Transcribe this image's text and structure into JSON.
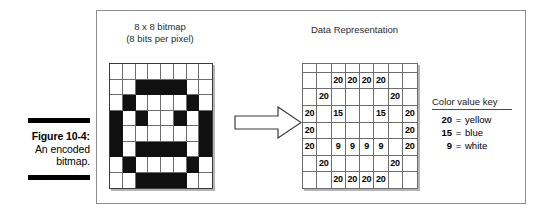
{
  "caption": {
    "figure_number": "Figure 10-4:",
    "line2": "An encoded",
    "line3": "bitmap."
  },
  "headings": {
    "bitmap_line1": "8 x 8 bitmap",
    "bitmap_line2": "(8 bits per pixel)",
    "data": "Data Representation"
  },
  "bitmap": {
    "rows": 8,
    "cols": 8,
    "pixels": [
      [
        0,
        0,
        0,
        0,
        0,
        0,
        0,
        0
      ],
      [
        0,
        0,
        1,
        1,
        1,
        1,
        0,
        0
      ],
      [
        0,
        1,
        0,
        0,
        0,
        0,
        1,
        0
      ],
      [
        1,
        0,
        1,
        0,
        0,
        1,
        0,
        1
      ],
      [
        1,
        0,
        0,
        0,
        0,
        0,
        0,
        1
      ],
      [
        1,
        0,
        1,
        1,
        1,
        1,
        0,
        1
      ],
      [
        0,
        1,
        0,
        0,
        0,
        0,
        1,
        0
      ],
      [
        0,
        0,
        1,
        1,
        1,
        1,
        0,
        0
      ]
    ]
  },
  "data_grid": {
    "rows": 8,
    "cols": 8,
    "values": [
      [
        "",
        "",
        "",
        "",
        "",
        "",
        "",
        ""
      ],
      [
        "",
        "",
        "20",
        "20",
        "20",
        "20",
        "",
        ""
      ],
      [
        "",
        "20",
        "",
        "",
        "",
        "",
        "20",
        ""
      ],
      [
        "20",
        "",
        "15",
        "",
        "",
        "15",
        "",
        "20"
      ],
      [
        "20",
        "",
        "",
        "",
        "",
        "",
        "",
        "20"
      ],
      [
        "20",
        "",
        "9",
        "9",
        "9",
        "9",
        "",
        "20"
      ],
      [
        "",
        "20",
        "",
        "",
        "",
        "",
        "20",
        ""
      ],
      [
        "",
        "",
        "20",
        "20",
        "20",
        "20",
        "",
        ""
      ]
    ]
  },
  "color_key": {
    "title": "Color value key",
    "entries": [
      {
        "value": "20",
        "eq": "=",
        "name": "yellow"
      },
      {
        "value": "15",
        "eq": "=",
        "name": "blue"
      },
      {
        "value": "9",
        "eq": "=",
        "name": "white"
      }
    ]
  },
  "colors": {
    "frame_border": "#8e8e8e",
    "bitmap_on": "#111111",
    "grid_line": "#6d6d6d",
    "caption_rule": "#000000",
    "arrow_fill": "#ffffff",
    "arrow_stroke": "#3a3a3a"
  }
}
